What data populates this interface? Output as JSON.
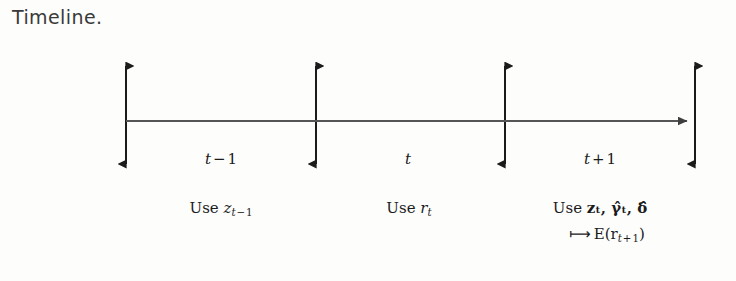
{
  "figure": {
    "title": "Timeline.",
    "background_color": "#fdfdfc",
    "ink_color": "#1b1b1b",
    "axis_color": "#555555"
  },
  "axis": {
    "name": "time-axis",
    "description": "horizontal time line with right arrowhead",
    "y": 121,
    "x_start": 126,
    "x_end": 695
  },
  "tick_arrows": [
    {
      "x": 126,
      "top": 58,
      "bottom": 172,
      "label": "boundary-1"
    },
    {
      "x": 316,
      "top": 58,
      "bottom": 172,
      "label": "boundary-2"
    },
    {
      "x": 505,
      "top": 58,
      "bottom": 172,
      "label": "boundary-3"
    },
    {
      "x": 695,
      "top": 58,
      "bottom": 172,
      "label": "boundary-4"
    }
  ],
  "periods": [
    {
      "id": "period-t-minus-1",
      "center_x": 221,
      "label": {
        "var": "t",
        "op": "−",
        "num": "1"
      },
      "annotation": {
        "prefix": "Use ",
        "symbol": "z",
        "subscript": {
          "var": "t",
          "op": "−",
          "num": "1"
        }
      }
    },
    {
      "id": "period-t",
      "center_x": 410,
      "label": {
        "var": "t",
        "op": "",
        "num": ""
      },
      "annotation": {
        "prefix": "Use ",
        "symbol": "r",
        "subscript": {
          "var": "t",
          "op": "",
          "num": ""
        }
      }
    },
    {
      "id": "period-t-plus-1",
      "center_x": 600,
      "label": {
        "var": "t",
        "op": "+",
        "num": "1"
      },
      "annotation": {
        "prefix": "Use ",
        "terms": "𝐳ₜ, γ̂ₜ, δ̂"
      },
      "mapsto": {
        "arrow": "⟼",
        "expression": "E(r",
        "subscript": {
          "var": "t",
          "op": "+",
          "num": "1"
        },
        "close": ")"
      }
    }
  ],
  "labels": {
    "use_word": "Use",
    "period_1_text": "t − 1",
    "period_2_text": "t",
    "period_3_text": "t + 1",
    "annotation_1_text": "Use z_{t−1}",
    "annotation_2_text": "Use r_t",
    "annotation_3_text": "Use z_t, γ̂_t, δ̂",
    "mapsto_text": "⟼ E(r_{t+1})"
  }
}
